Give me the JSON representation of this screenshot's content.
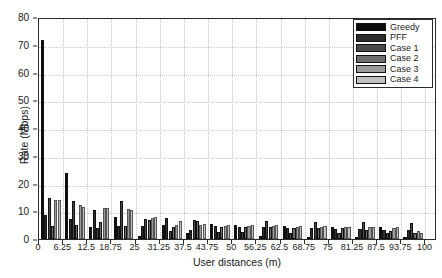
{
  "chart_data": {
    "type": "bar",
    "title": "",
    "xlabel": "User distances (m)",
    "ylabel": "Rate (Mbps)",
    "xlim": [
      0,
      103
    ],
    "ylim": [
      0,
      80
    ],
    "ytick_values": [
      0,
      10,
      20,
      30,
      40,
      50,
      60,
      70,
      80
    ],
    "ytick_labels": [
      "0",
      "10",
      "20",
      "30",
      "40",
      "50",
      "60",
      "70",
      "80"
    ],
    "xtick_values": [
      0,
      6.25,
      12.5,
      18.75,
      25,
      31.25,
      37.5,
      43.75,
      50,
      56.25,
      62.5,
      68.75,
      75,
      81.25,
      87.5,
      93.75,
      100
    ],
    "xtick_labels": [
      "0",
      "6.25",
      "12.5",
      "18.75",
      "25",
      "31.25",
      "37.5",
      "43.75",
      "50",
      "56.25",
      "62.5",
      "68.75",
      "75",
      "81.25",
      "87.5",
      "93.75",
      "100"
    ],
    "grid": true,
    "legend_position": "top-right",
    "categories": [
      3.1,
      9.4,
      15.6,
      21.9,
      28.1,
      34.4,
      40.6,
      46.9,
      53.1,
      59.4,
      65.6,
      71.9,
      78.1,
      84.4,
      90.6,
      96.9
    ],
    "series": [
      {
        "name": "Greedy",
        "color": "#0d0d0d",
        "values": [
          71.8,
          23.8,
          4.5,
          8.0,
          1.2,
          5.0,
          2.2,
          5.3,
          5.0,
          1.2,
          4.6,
          0.9,
          4.4,
          0.6,
          4.3,
          0.5
        ]
      },
      {
        "name": "PFF",
        "color": "#2e2e2e",
        "values": [
          8.8,
          7.2,
          10.4,
          4.8,
          4.8,
          7.5,
          3.3,
          4.7,
          4.5,
          4.3,
          4.0,
          3.9,
          3.7,
          3.6,
          3.4,
          3.3
        ]
      },
      {
        "name": "Case 1",
        "color": "#4a4a4a",
        "values": [
          14.8,
          13.8,
          3.8,
          13.6,
          7.2,
          2.9,
          6.9,
          2.6,
          2.4,
          6.6,
          2.3,
          6.3,
          2.2,
          6.0,
          2.1,
          5.8
        ]
      },
      {
        "name": "Case 2",
        "color": "#6e6e6e",
        "values": [
          4.6,
          5.2,
          6.0,
          4.6,
          6.8,
          4.5,
          6.4,
          4.4,
          4.3,
          4.2,
          4.1,
          4.0,
          3.9,
          3.1,
          3.0,
          2.3
        ]
      },
      {
        "name": "Case 3",
        "color": "#9a9a9a",
        "values": [
          14.1,
          12.4,
          11.2,
          10.8,
          7.6,
          5.0,
          4.9,
          4.8,
          4.7,
          4.6,
          4.5,
          4.4,
          4.3,
          4.2,
          4.1,
          3.0
        ]
      },
      {
        "name": "Case 4",
        "color": "#c2c2c2",
        "values": [
          14.0,
          11.6,
          11.0,
          10.6,
          8.0,
          6.6,
          5.4,
          5.2,
          5.0,
          4.9,
          4.7,
          4.6,
          4.4,
          4.3,
          4.2,
          2.0
        ]
      }
    ]
  },
  "legend": {
    "entries": [
      {
        "label": "Greedy",
        "color": "#0d0d0d"
      },
      {
        "label": "PFF",
        "color": "#2e2e2e"
      },
      {
        "label": "Case 1",
        "color": "#4a4a4a"
      },
      {
        "label": "Case 2",
        "color": "#6e6e6e"
      },
      {
        "label": "Case 3",
        "color": "#9a9a9a"
      },
      {
        "label": "Case 4",
        "color": "#c2c2c2"
      }
    ]
  }
}
